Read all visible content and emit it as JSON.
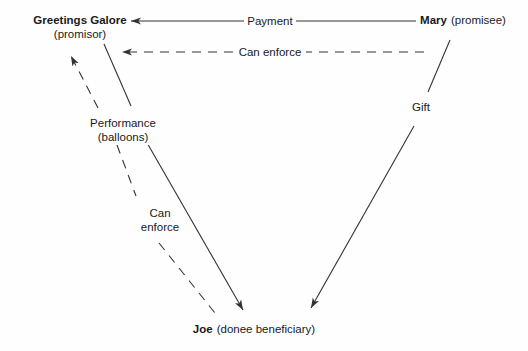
{
  "diagram": {
    "background_color": "#fefefe",
    "line_color": "#333333",
    "text_color": "#1a1a1a",
    "nodes": [
      {
        "id": "promisor",
        "name": "Greetings Galore",
        "role": "(promisor)",
        "x": 80,
        "y": 22
      },
      {
        "id": "promisee",
        "name": "Mary",
        "role": "(promisee)",
        "x": 463,
        "y": 22
      },
      {
        "id": "beneficiary",
        "name": "Joe",
        "role": "(donee beneficiary)",
        "x": 254,
        "y": 330
      }
    ],
    "edges": [
      {
        "id": "payment",
        "label": "Payment",
        "style": "solid",
        "from": "promisee",
        "to": "promisor",
        "arrow": "to"
      },
      {
        "id": "can-enforce-top",
        "label": "Can enforce",
        "style": "dashed",
        "from": "promisee",
        "to": "promisor",
        "arrow": "to"
      },
      {
        "id": "performance",
        "label_line1": "Performance",
        "label_line2": "(balloons)",
        "style": "solid",
        "from": "promisor",
        "to": "beneficiary",
        "arrow": "to"
      },
      {
        "id": "can-enforce-left",
        "label_line1": "Can",
        "label_line2": "enforce",
        "style": "dashed",
        "from": "beneficiary",
        "to": "promisor",
        "arrow": "to"
      },
      {
        "id": "gift",
        "label": "Gift",
        "style": "solid",
        "from": "promisee",
        "to": "beneficiary",
        "arrow": "to"
      }
    ]
  }
}
